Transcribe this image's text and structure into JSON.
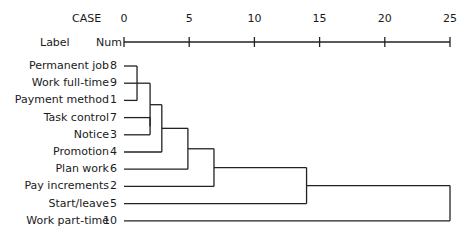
{
  "header": {
    "case_label": "CASE",
    "label_label": "Label",
    "num_label": "Num"
  },
  "chart_data": {
    "type": "dendrogram",
    "title": "",
    "xlabel": "Rescaled Distance Cluster Combine",
    "axis": {
      "ticks": [
        0,
        5,
        10,
        15,
        20,
        25
      ],
      "tick_labels": [
        "0",
        "5",
        "10",
        "15",
        "20",
        "25"
      ],
      "range": [
        0,
        25
      ]
    },
    "leaves": [
      {
        "label": "Permanent job",
        "num": "8"
      },
      {
        "label": "Work full-time",
        "num": "9"
      },
      {
        "label": "Payment method",
        "num": "1"
      },
      {
        "label": "Task control",
        "num": "7"
      },
      {
        "label": "Notice",
        "num": "3"
      },
      {
        "label": "Promotion",
        "num": "4"
      },
      {
        "label": "Plan work",
        "num": "6"
      },
      {
        "label": "Pay increments",
        "num": "2"
      },
      {
        "label": "Start/leave",
        "num": "5"
      },
      {
        "label": "Work part-time",
        "num": "10"
      }
    ],
    "merges": [
      {
        "members": [
          "8",
          "1"
        ],
        "distance": 1.0
      },
      {
        "members": [
          "8,1",
          "9"
        ],
        "distance": 1.0
      },
      {
        "members": [
          "7",
          "3"
        ],
        "distance": 2.0
      },
      {
        "members": [
          "8,9,1",
          "7,3"
        ],
        "distance": 2.0
      },
      {
        "members": [
          "8,9,1,7,3",
          "4"
        ],
        "distance": 2.9
      },
      {
        "members": [
          "8,9,1,7,3,4",
          "6"
        ],
        "distance": 4.9
      },
      {
        "members": [
          "8,9,1,7,3,4,6",
          "2"
        ],
        "distance": 6.9
      },
      {
        "members": [
          "8,9,1,7,3,4,6,2",
          "5"
        ],
        "distance": 14.0
      },
      {
        "members": [
          "8,9,1,7,3,4,6,2,5",
          "10"
        ],
        "distance": 25.0
      }
    ],
    "grid": false,
    "legend": null
  }
}
